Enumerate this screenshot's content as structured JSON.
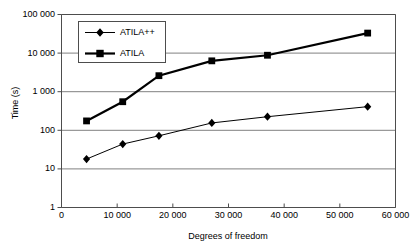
{
  "chart_data": {
    "type": "line",
    "title": "",
    "xlabel": "Degrees of freedom",
    "ylabel": "Time (s)",
    "xlim": [
      0,
      60000
    ],
    "ylim": [
      1,
      100000
    ],
    "yscale": "log",
    "xscale": "linear",
    "grid": true,
    "grid_axis": "y",
    "legend_position": "upper-left-inside",
    "xticks": [
      0,
      10000,
      20000,
      30000,
      40000,
      50000,
      60000
    ],
    "xtick_labels": [
      "0",
      "10 000",
      "20 000",
      "30 000",
      "40 000",
      "50 000",
      "60 000"
    ],
    "yticks": [
      1,
      10,
      100,
      1000,
      10000,
      100000
    ],
    "ytick_labels": [
      "1",
      "10",
      "100",
      "1 000",
      "10 000",
      "100 000"
    ],
    "series": [
      {
        "name": "ATILA++",
        "marker": "diamond",
        "color": "#000000",
        "line_width": 1,
        "x": [
          4500,
          11000,
          17500,
          27000,
          37000,
          55000
        ],
        "y": [
          18,
          44,
          72,
          155,
          225,
          410
        ]
      },
      {
        "name": "ATILA",
        "marker": "square",
        "color": "#000000",
        "line_width": 2.2,
        "x": [
          4500,
          11000,
          17500,
          27000,
          37000,
          55000
        ],
        "y": [
          175,
          550,
          2600,
          6300,
          8800,
          33000
        ]
      }
    ]
  },
  "style": {
    "plot_background": "#ffffff",
    "axis_color": "#4d4d4d",
    "grid_color": "#808080",
    "text_color": "#000000"
  }
}
